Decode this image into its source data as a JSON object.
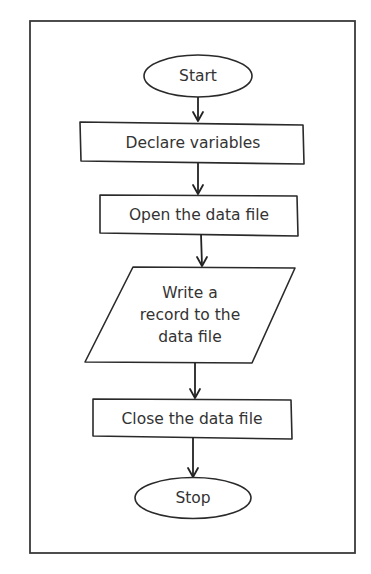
{
  "diagram": {
    "type": "flowchart",
    "nodes": [
      {
        "id": "start",
        "shape": "terminator",
        "label": "Start"
      },
      {
        "id": "declare",
        "shape": "process",
        "label": "Declare variables"
      },
      {
        "id": "open",
        "shape": "process",
        "label": "Open the data file"
      },
      {
        "id": "write",
        "shape": "input-output",
        "lines": [
          "Write a",
          "record to the",
          "data file"
        ]
      },
      {
        "id": "close",
        "shape": "process",
        "label": "Close the data file"
      },
      {
        "id": "stop",
        "shape": "terminator",
        "label": "Stop"
      }
    ],
    "edges": [
      {
        "from": "start",
        "to": "declare"
      },
      {
        "from": "declare",
        "to": "open"
      },
      {
        "from": "open",
        "to": "write"
      },
      {
        "from": "write",
        "to": "close"
      },
      {
        "from": "close",
        "to": "stop"
      }
    ],
    "colors": {
      "stroke": "#2a2a2a",
      "text": "#333333",
      "background": "#ffffff"
    }
  }
}
